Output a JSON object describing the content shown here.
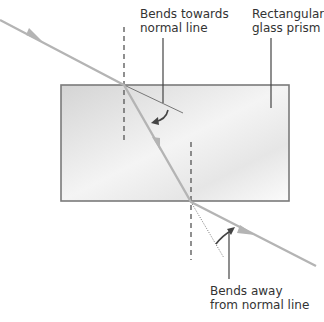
{
  "labels": {
    "towards_line1": "Bends towards",
    "towards_line2": "normal line",
    "prism_line1": "Rectangular",
    "prism_line2": "glass prism",
    "away_line1": "Bends away",
    "away_line2": "from normal line"
  },
  "colors": {
    "ray": "#b4b4b4",
    "prism_border": "#7a7a7a",
    "prism_fill_light": "#fafafa",
    "prism_fill_dark": "#d9d9d9",
    "normal_line": "#555555",
    "annotation": "#444444",
    "text": "#333333"
  }
}
